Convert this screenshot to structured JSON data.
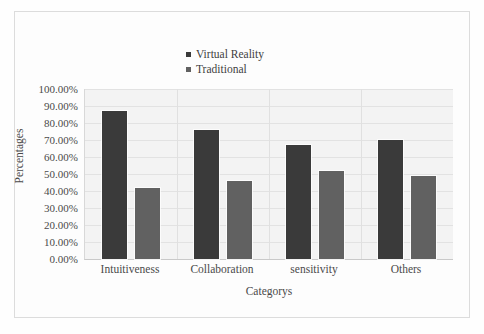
{
  "chart_data": {
    "type": "bar",
    "title": "",
    "xlabel": "Categorys",
    "ylabel": "Percentages",
    "categories": [
      "Intuitiveness",
      "Collaboration",
      "sensitivity",
      "Others"
    ],
    "series": [
      {
        "name": "Virtual Reality",
        "color": "#3a3a3a",
        "values": [
          87,
          76,
          67,
          70
        ]
      },
      {
        "name": "Traditional",
        "color": "#616161",
        "values": [
          42,
          46,
          52,
          49
        ]
      }
    ],
    "ylim": [
      0,
      100
    ],
    "ytick_labels": [
      "100.00%",
      "90.00%",
      "80.00%",
      "70.00%",
      "60.00%",
      "50.00%",
      "40.00%",
      "30.00%",
      "20.00%",
      "10.00%",
      "0.00%"
    ],
    "ytick_values": [
      100,
      90,
      80,
      70,
      60,
      50,
      40,
      30,
      20,
      10,
      0
    ],
    "grid": true,
    "legend_position": "top-center",
    "plot_background": "#f3f3f3",
    "figure_background": "#fdfdfd"
  }
}
